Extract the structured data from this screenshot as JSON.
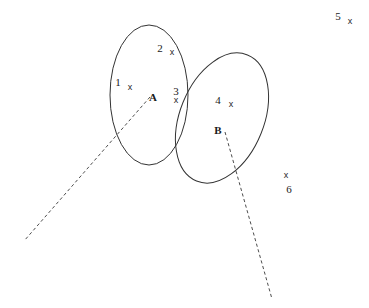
{
  "figure": {
    "width": 369,
    "height": 308,
    "background_color": "#ffffff",
    "stroke_color": "#333333",
    "dash_color": "#4d4d4d",
    "text_color": "#1a1a1a"
  },
  "sets": [
    {
      "id": "A",
      "label": "A",
      "label_x": 153,
      "label_y": 101,
      "shape": "ellipse",
      "cx": 149,
      "cy": 95,
      "rx": 39,
      "ry": 70,
      "rotation": 0,
      "members": [
        "1",
        "2",
        "3"
      ]
    },
    {
      "id": "B",
      "label": "B",
      "label_x": 214,
      "label_y": 134,
      "shape": "ellipse",
      "cx": 222,
      "cy": 118,
      "rx": 42,
      "ry": 68,
      "rotation": 22,
      "members": [
        "3",
        "4"
      ]
    }
  ],
  "points": [
    {
      "id": "1",
      "label": "1",
      "label_x": 118,
      "label_y": 86,
      "x": 130,
      "y": 90,
      "marker": "x",
      "region": "A-only"
    },
    {
      "id": "2",
      "label": "2",
      "label_x": 160,
      "label_y": 52,
      "x": 172,
      "y": 55,
      "marker": "x",
      "region": "A-only"
    },
    {
      "id": "3",
      "label": "3",
      "label_x": 173,
      "label_y": 95,
      "x": 176,
      "y": 101,
      "marker": "x",
      "region": "A-and-B"
    },
    {
      "id": "4",
      "label": "4",
      "label_x": 218,
      "label_y": 104,
      "x": 231,
      "y": 107,
      "marker": "x",
      "region": "B-only"
    },
    {
      "id": "5",
      "label": "5",
      "label_x": 338,
      "label_y": 20,
      "x": 350,
      "y": 23,
      "marker": "x",
      "region": "outside"
    },
    {
      "id": "6",
      "label": "6",
      "label_x": 287,
      "label_y": 193,
      "x": 286,
      "y": 177,
      "marker": "x",
      "region": "outside"
    }
  ],
  "leaders": [
    {
      "id": "leader-a",
      "for_set": "A",
      "x1": 150,
      "y1": 97,
      "x2": 24,
      "y2": 241
    },
    {
      "id": "leader-b",
      "for_set": "B",
      "x1": 225,
      "y1": 132,
      "x2": 272,
      "y2": 299
    }
  ]
}
